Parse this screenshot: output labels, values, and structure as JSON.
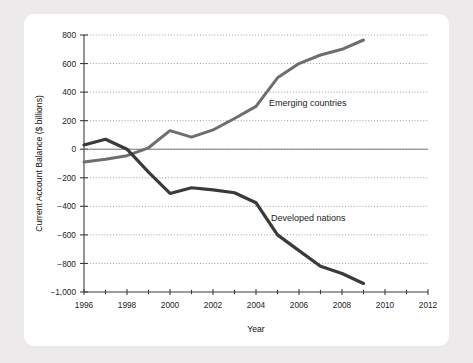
{
  "chart_data": {
    "type": "line",
    "title": "",
    "xlabel": "Year",
    "ylabel": "Current Account Balance ($ billions)",
    "xlim": [
      1996,
      2012
    ],
    "ylim": [
      -1000,
      800
    ],
    "grid": true,
    "legend_position": "inline-annotations",
    "y_ticks": [
      800,
      600,
      400,
      200,
      0,
      -200,
      -400,
      -600,
      -800,
      -1000
    ],
    "y_tick_labels": [
      "800",
      "600",
      "400",
      "200",
      "0",
      "−200",
      "−400",
      "−600",
      "−800",
      "−1,000"
    ],
    "x_ticks": [
      1996,
      1997,
      1998,
      1999,
      2000,
      2001,
      2002,
      2003,
      2004,
      2005,
      2006,
      2007,
      2008,
      2009,
      2010,
      2011,
      2012
    ],
    "x_tick_labels": [
      "1996",
      "",
      "1998",
      "",
      "2000",
      "",
      "2002",
      "",
      "2004",
      "",
      "2006",
      "",
      "2008",
      "",
      "2010",
      "",
      "2012"
    ],
    "x_major_labels": [
      "1996",
      "1998",
      "2000",
      "2002",
      "2004",
      "2006",
      "2008",
      "2010",
      "2012"
    ],
    "x": [
      1996,
      1997,
      1998,
      1999,
      2000,
      2001,
      2002,
      2003,
      2004,
      2005,
      2006,
      2007,
      2008,
      2009
    ],
    "series": [
      {
        "name": "Emerging countries",
        "color": "#6e6e6e",
        "stroke_width": 3.0,
        "label_x": 2004.6,
        "label_y": 300,
        "values": [
          -90,
          -70,
          -45,
          10,
          130,
          85,
          135,
          215,
          300,
          500,
          600,
          660,
          700,
          765
        ]
      },
      {
        "name": "Developed nations",
        "color": "#3a3a3a",
        "stroke_width": 3.2,
        "label_x": 2004.7,
        "label_y": -505,
        "values": [
          30,
          70,
          0,
          -160,
          -310,
          -270,
          -285,
          -305,
          -375,
          -600,
          -710,
          -820,
          -870,
          -940
        ]
      }
    ]
  },
  "page": {
    "background_color": "#eceaea",
    "card_color": "#ffffff"
  }
}
